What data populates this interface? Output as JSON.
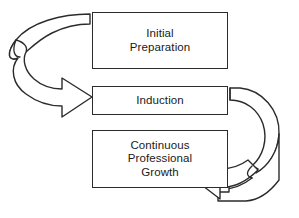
{
  "diagram": {
    "type": "cycle-flow",
    "background_color": "#ffffff",
    "stroke_color": "#2b2b2b",
    "text_color": "#1a1a1a",
    "stages": [
      {
        "id": "initial-preparation",
        "label": "Initial\nPreparation",
        "order": 1
      },
      {
        "id": "induction",
        "label": "Induction",
        "order": 2
      },
      {
        "id": "continuous-growth",
        "label": "Continuous\nProfessional\nGrowth",
        "order": 3
      }
    ],
    "connectors": [
      {
        "id": "left-curved-arrow",
        "name": "curved-arrow-icon",
        "from": "initial-preparation",
        "to": "induction",
        "direction": "right",
        "side": "left",
        "style": "ribbon-curve"
      },
      {
        "id": "right-curved-arrow",
        "name": "curved-arrow-icon",
        "from": "induction",
        "to": "continuous-growth",
        "direction": "left",
        "side": "right",
        "style": "ribbon-curve"
      }
    ]
  }
}
